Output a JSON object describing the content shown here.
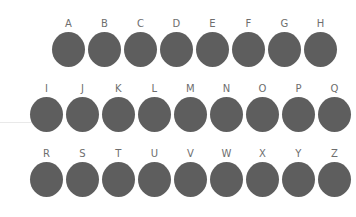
{
  "canvas": {
    "width": 356,
    "height": 217,
    "background_color": "#ffffff"
  },
  "style": {
    "dot_color": "#5e5e5e",
    "label_color": "#6e6e6e",
    "hairline_color": "#e9e9e9",
    "dot_width": 33,
    "dot_height": 35,
    "label_font_size": 10
  },
  "decorations": {
    "hairline": {
      "x": 0,
      "y": 122,
      "width": 38
    }
  },
  "grid": {
    "rows": [
      {
        "name": "row-1",
        "label_y": 19,
        "dot_y": 32,
        "start_x": 52,
        "pitch": 36,
        "items": [
          {
            "label": "A"
          },
          {
            "label": "B"
          },
          {
            "label": "C"
          },
          {
            "label": "D"
          },
          {
            "label": "E"
          },
          {
            "label": "F"
          },
          {
            "label": "G"
          },
          {
            "label": "H"
          }
        ]
      },
      {
        "name": "row-2",
        "label_y": 84,
        "dot_y": 97,
        "start_x": 30,
        "pitch": 36,
        "items": [
          {
            "label": "I"
          },
          {
            "label": "J"
          },
          {
            "label": "K"
          },
          {
            "label": "L"
          },
          {
            "label": "M"
          },
          {
            "label": "N"
          },
          {
            "label": "O"
          },
          {
            "label": "P"
          },
          {
            "label": "Q"
          }
        ]
      },
      {
        "name": "row-3",
        "label_y": 149,
        "dot_y": 162,
        "start_x": 30,
        "pitch": 36,
        "items": [
          {
            "label": "R"
          },
          {
            "label": "S"
          },
          {
            "label": "T"
          },
          {
            "label": "U"
          },
          {
            "label": "V"
          },
          {
            "label": "W"
          },
          {
            "label": "X"
          },
          {
            "label": "Y"
          },
          {
            "label": "Z"
          }
        ]
      }
    ]
  }
}
